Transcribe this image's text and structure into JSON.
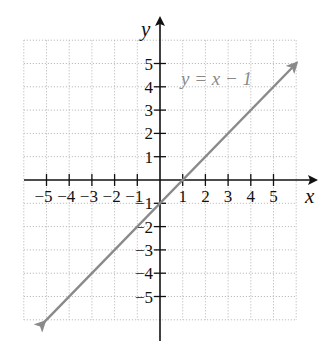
{
  "chart_data": {
    "type": "line",
    "title": "",
    "xlabel": "x",
    "ylabel": "y",
    "xlim": [
      -6,
      6
    ],
    "ylim": [
      -6,
      6
    ],
    "grid": true,
    "x_ticks": [
      -5,
      -4,
      -3,
      -2,
      -1,
      1,
      2,
      3,
      4,
      5
    ],
    "y_ticks": [
      5,
      4,
      3,
      2,
      1,
      -1,
      -2,
      -3,
      -4,
      -5
    ],
    "x_tick_labels": [
      "−5",
      "−4",
      "−3",
      "−2",
      "−1",
      "1",
      "2",
      "3",
      "4",
      "5"
    ],
    "y_tick_labels": [
      "5",
      "4",
      "3",
      "2",
      "1",
      "−1",
      "−2",
      "−3",
      "−4",
      "−5"
    ],
    "series": [
      {
        "name": "y = x − 1",
        "equation": "y = x - 1",
        "x": [
          -5.1,
          6
        ],
        "y": [
          -6.1,
          5
        ],
        "arrows": "both",
        "color": "#8a8a8a"
      }
    ],
    "annotations": [
      {
        "text": "y = x − 1",
        "x": 1.2,
        "y": 4.1
      }
    ]
  },
  "labels": {
    "x_axis": "x",
    "y_axis": "y",
    "equation": "y = x − 1"
  },
  "colors": {
    "axis": "#111111",
    "grid": "#bdbdbd",
    "line": "#8a8a8a",
    "label": "#8a8a8a"
  }
}
